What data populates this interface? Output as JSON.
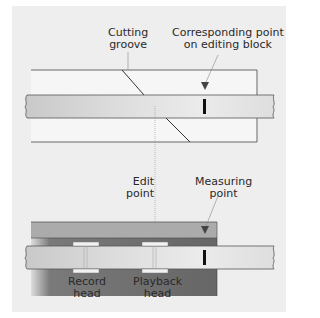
{
  "diagram": {
    "labels": {
      "cutting_groove_line1": "Cutting",
      "cutting_groove_line2": "groove",
      "corresponding_line1": "Corresponding point",
      "corresponding_line2": "on editing block",
      "edit_point_line1": "Edit",
      "edit_point_line2": "point",
      "measuring_line1": "Measuring",
      "measuring_line2": "point",
      "record_head_line1": "Record",
      "record_head_line2": "head",
      "playback_head_line1": "Playback",
      "playback_head_line2": "head"
    },
    "colors": {
      "panel_background": "#eeeeee",
      "tape": "#d6d6d6",
      "editing_block": "#f4f4f4",
      "head_block_top": "#a9a9a9",
      "head_block_dark": "#6e6e6e",
      "mark": "#111111",
      "guide_line": "#9a9a9a"
    }
  }
}
